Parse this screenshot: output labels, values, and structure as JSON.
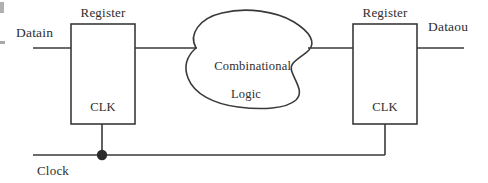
{
  "diagram": {
    "stroke_color": "#3a3a3a",
    "text_color": "#2e2e2e",
    "background_color": "#ffffff",
    "signals": {
      "data_in": "Datain",
      "data_out": "Dataou",
      "clock": "Clock"
    },
    "blocks": [
      {
        "id": "register-1",
        "label": "Register",
        "clock_port_label": "CLK",
        "shape": "rectangle",
        "x": 71,
        "y": 24,
        "width": 64,
        "height": 100
      },
      {
        "id": "combinational-logic",
        "label_line1": "Combinational",
        "label_line2": "Logic",
        "shape": "cloud",
        "x": 188,
        "y": 12,
        "width": 126,
        "height": 96
      },
      {
        "id": "register-2",
        "label": "Register",
        "clock_port_label": "CLK",
        "shape": "rectangle",
        "x": 353,
        "y": 24,
        "width": 64,
        "height": 100
      }
    ],
    "wires": [
      {
        "id": "datain-wire",
        "from": "input-port",
        "to": "register-1"
      },
      {
        "id": "reg1-to-logic-wire",
        "from": "register-1",
        "to": "combinational-logic"
      },
      {
        "id": "logic-to-reg2-wire",
        "from": "combinational-logic",
        "to": "register-2"
      },
      {
        "id": "dataout-wire",
        "from": "register-2",
        "to": "output-port"
      },
      {
        "id": "clock-bus",
        "from": "clock-source",
        "to": "register-2-clk"
      },
      {
        "id": "clock-stub-reg1",
        "from": "clock-bus",
        "to": "register-1-clk"
      },
      {
        "id": "clock-riser-reg2",
        "from": "clock-bus",
        "to": "register-2-clk"
      }
    ],
    "junction": {
      "id": "clock-junction-dot",
      "x": 102,
      "y": 155,
      "radius": 5
    }
  }
}
